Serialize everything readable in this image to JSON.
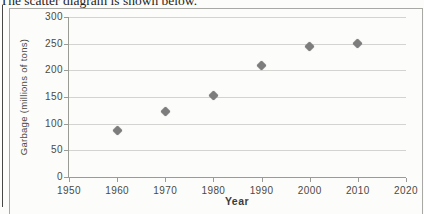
{
  "page": {
    "heading": "The scatter diagram is shown below."
  },
  "chart_data": {
    "type": "scatter",
    "title": "",
    "xlabel": "Year",
    "ylabel": "Garbage (millions of tons)",
    "x": [
      1960,
      1970,
      1980,
      1990,
      2000,
      2010
    ],
    "values": [
      88,
      122,
      153,
      210,
      245,
      251
    ],
    "xlim": [
      1950,
      2020
    ],
    "ylim": [
      0,
      300
    ],
    "x_ticks": [
      "1950",
      "1960",
      "1970",
      "1980",
      "1990",
      "2000",
      "2010",
      "2020"
    ],
    "y_ticks": [
      "0",
      "50",
      "100",
      "150",
      "200",
      "250",
      "300"
    ],
    "grid": "horizontal-only",
    "legend_position": "none",
    "marker": "diamond",
    "colors": {
      "marker": "#7d7d7d",
      "gridline": "#d3d3d0",
      "axis": "#9a9a96",
      "tick_label": "#4a4a45",
      "chart_border": "#a8a8a4",
      "outer_rule": "#474747",
      "paper": "#fcfcfa",
      "heading_text": "#1e1e1e"
    }
  }
}
